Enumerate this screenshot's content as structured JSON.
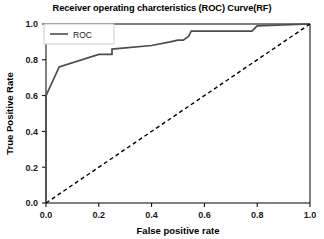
{
  "chart_data": {
    "type": "line",
    "title": "Receiver operating charcteristics (ROC) Curve(RF)",
    "xlabel": "False positive rate",
    "ylabel": "True Positive Rate",
    "xlim": [
      0.0,
      1.0
    ],
    "ylim": [
      0.0,
      1.0
    ],
    "xticks": [
      "0.0",
      "0.2",
      "0.4",
      "0.6",
      "0.8",
      "1.0"
    ],
    "xtick_values": [
      0.0,
      0.2,
      0.4,
      0.6,
      0.8,
      1.0
    ],
    "yticks": [
      "0.0",
      "0.2",
      "0.4",
      "0.6",
      "0.8",
      "1.0"
    ],
    "ytick_values": [
      0.0,
      0.2,
      0.4,
      0.6,
      0.8,
      1.0
    ],
    "grid": false,
    "legend_position": "upper left",
    "series": [
      {
        "name": "ROC",
        "style": "solid",
        "color": "#4d4d4d",
        "x": [
          0.0,
          0.0,
          0.05,
          0.2,
          0.25,
          0.25,
          0.25,
          0.4,
          0.47,
          0.5,
          0.52,
          0.54,
          0.55,
          0.78,
          0.8,
          1.0
        ],
        "y": [
          0.0,
          0.6,
          0.76,
          0.83,
          0.83,
          0.86,
          0.86,
          0.88,
          0.9,
          0.91,
          0.91,
          0.93,
          0.96,
          0.96,
          0.99,
          1.0
        ]
      },
      {
        "name": "chance",
        "style": "dashed",
        "color": "#000000",
        "x": [
          0.0,
          1.0
        ],
        "y": [
          0.0,
          1.0
        ]
      }
    ],
    "legend": [
      {
        "label": "ROC",
        "color": "#4d4d4d",
        "style": "solid"
      }
    ]
  }
}
